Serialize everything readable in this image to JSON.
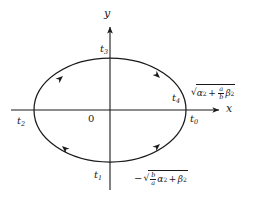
{
  "figure": {
    "title_semantic": "ellipse-with-parameter-points",
    "axes": {
      "x_label": "x",
      "y_label": "y",
      "origin_label": "0"
    },
    "stroke_color": "#1a1a1a",
    "background_color": "#ffffff",
    "curve": {
      "type": "ellipse",
      "center": [
        110,
        110
      ],
      "radius_x": 76,
      "radius_y": 52,
      "orientation": "clockwise"
    },
    "point_labels": [
      {
        "name": "t0",
        "base": "t",
        "sub": "0"
      },
      {
        "name": "t1",
        "base": "t",
        "sub": "1"
      },
      {
        "name": "t2",
        "base": "t",
        "sub": "2"
      },
      {
        "name": "t3",
        "base": "t",
        "sub": "3"
      },
      {
        "name": "t4",
        "base": "t",
        "sub": "4"
      }
    ],
    "expressions": {
      "top_right": {
        "plain": "sqrt(alpha^2 + (a/b) beta^2)",
        "radicand_first_var": "α",
        "radicand_first_exp": "2",
        "operator": "+",
        "frac_num": "a",
        "frac_den": "b",
        "radicand_second_var": "β",
        "radicand_second_exp": "2"
      },
      "bottom": {
        "plain": "-sqrt((b/a) alpha^2 + beta^2)",
        "leading_sign": "−",
        "frac_num": "b",
        "frac_den": "a",
        "radicand_first_var": "α",
        "radicand_first_exp": "2",
        "operator": "+",
        "radicand_second_var": "β",
        "radicand_second_exp": "2"
      }
    }
  }
}
